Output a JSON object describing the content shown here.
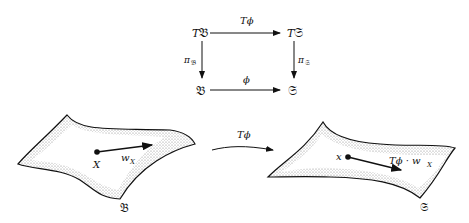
{
  "commutative_diagram": {
    "top_left": {
      "prefix": "T",
      "symbol": "𝔅"
    },
    "top_right": {
      "prefix": "T",
      "symbol": "𝔖"
    },
    "bottom_left": {
      "symbol": "𝔅"
    },
    "bottom_right": {
      "symbol": "𝔖"
    },
    "top_arrow_label": "Tϕ",
    "bottom_arrow_label": "ϕ",
    "left_arrow_label": {
      "main": "π",
      "sub": "𝔅"
    },
    "right_arrow_label": {
      "main": "π",
      "sub": "𝔖"
    }
  },
  "left_surface": {
    "point_label": "X",
    "vector_label": {
      "main": "w",
      "sub": "X"
    },
    "surface_label": "𝔅"
  },
  "map_arrow": {
    "label": "Tϕ"
  },
  "right_surface": {
    "point_label": "x",
    "vector_label": {
      "main": "Tϕ · w",
      "sub": "X"
    },
    "surface_label": "𝔖"
  }
}
